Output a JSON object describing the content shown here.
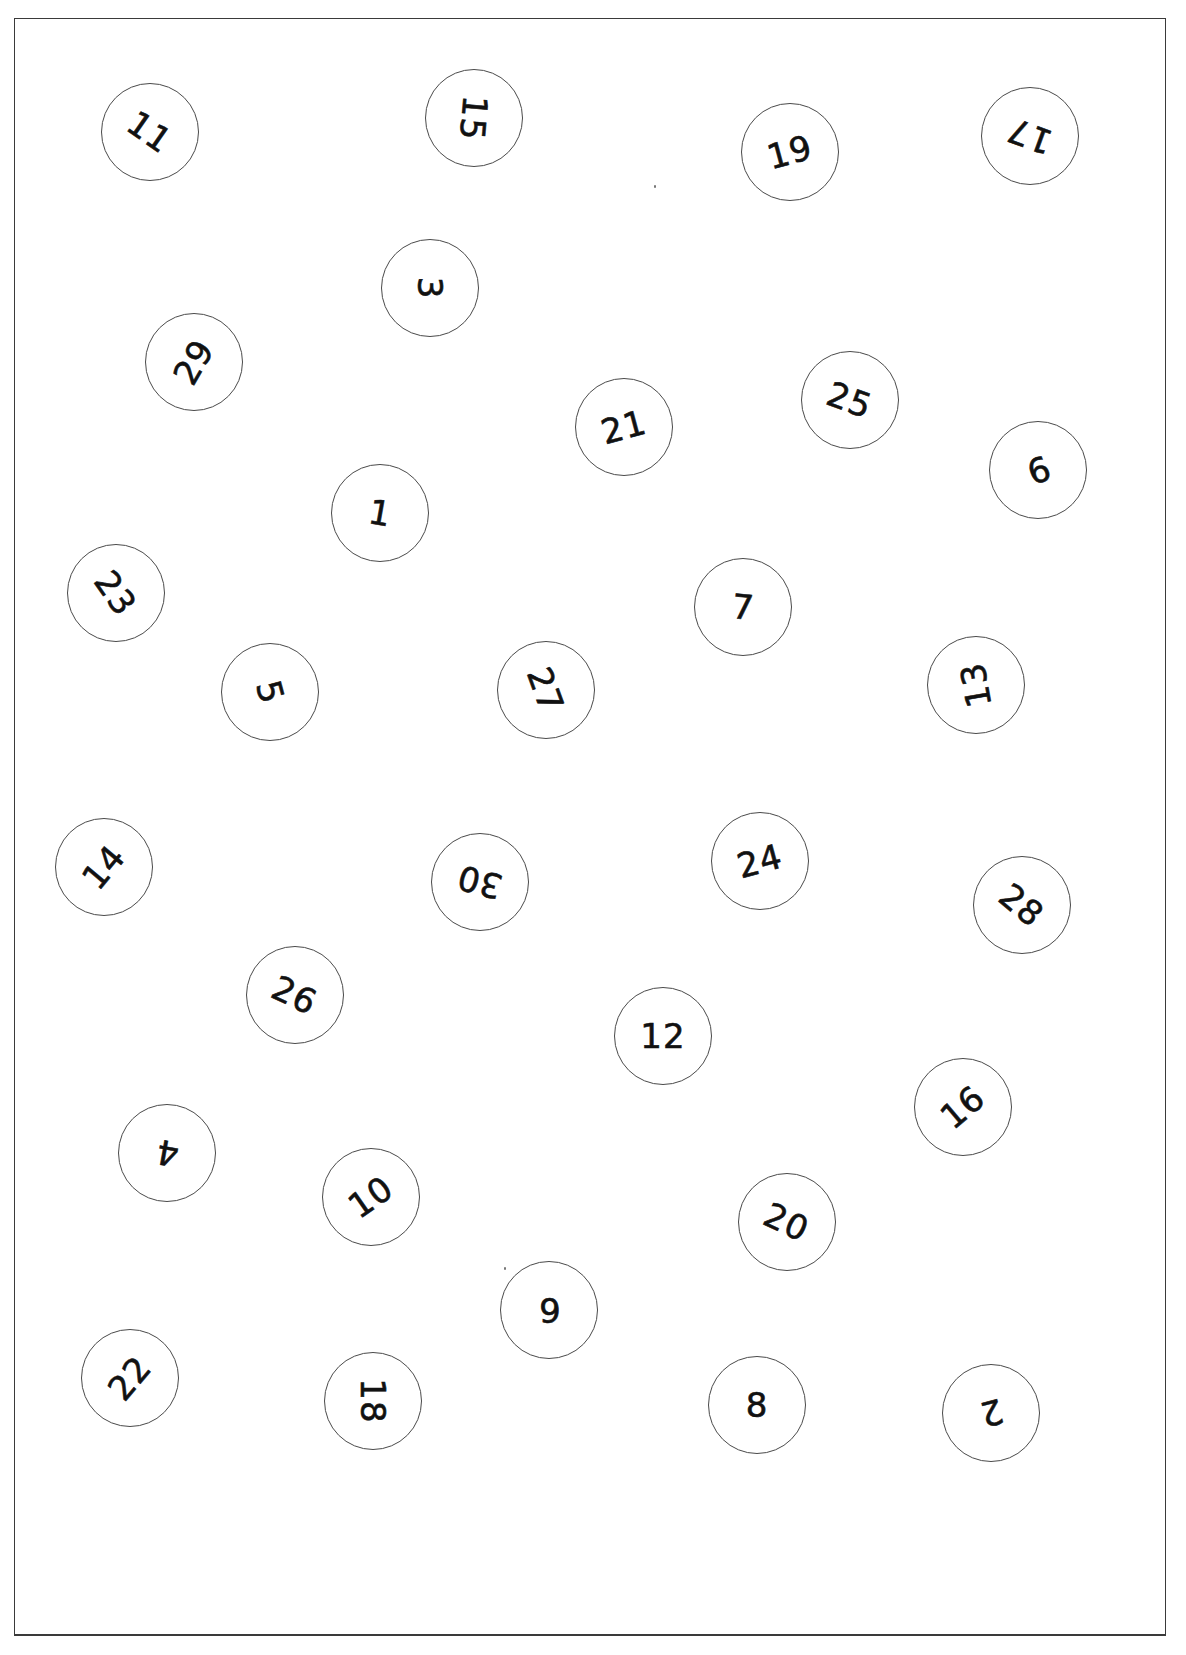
{
  "worksheet": {
    "type": "number-ordering-worksheet",
    "border_color": "#3a3a3a",
    "circle_border_color": "#4a4a4a",
    "text_color": "#111111",
    "circles": [
      {
        "label": "11",
        "x": 150,
        "y": 132,
        "rotate": 35
      },
      {
        "label": "15",
        "x": 474,
        "y": 118,
        "rotate": 95
      },
      {
        "label": "19",
        "x": 790,
        "y": 152,
        "rotate": -15
      },
      {
        "label": "17",
        "x": 1030,
        "y": 136,
        "rotate": 200
      },
      {
        "label": "3",
        "x": 430,
        "y": 288,
        "rotate": 90
      },
      {
        "label": "29",
        "x": 194,
        "y": 362,
        "rotate": -60
      },
      {
        "label": "21",
        "x": 624,
        "y": 427,
        "rotate": -15
      },
      {
        "label": "25",
        "x": 850,
        "y": 400,
        "rotate": 20
      },
      {
        "label": "9",
        "x": 1038,
        "y": 470,
        "rotate": 160
      },
      {
        "label": "1",
        "x": 380,
        "y": 513,
        "rotate": 10
      },
      {
        "label": "23",
        "x": 116,
        "y": 593,
        "rotate": 55
      },
      {
        "label": "7",
        "x": 743,
        "y": 607,
        "rotate": 5
      },
      {
        "label": "5",
        "x": 270,
        "y": 692,
        "rotate": 75
      },
      {
        "label": "27",
        "x": 546,
        "y": 690,
        "rotate": 70
      },
      {
        "label": "13",
        "x": 976,
        "y": 685,
        "rotate": 260
      },
      {
        "label": "14",
        "x": 104,
        "y": 867,
        "rotate": -50
      },
      {
        "label": "30",
        "x": 480,
        "y": 882,
        "rotate": 195
      },
      {
        "label": "24",
        "x": 760,
        "y": 861,
        "rotate": -15
      },
      {
        "label": "28",
        "x": 1022,
        "y": 905,
        "rotate": 40
      },
      {
        "label": "26",
        "x": 295,
        "y": 995,
        "rotate": 25
      },
      {
        "label": "12",
        "x": 663,
        "y": 1036,
        "rotate": 0
      },
      {
        "label": "16",
        "x": 963,
        "y": 1107,
        "rotate": -40
      },
      {
        "label": "4",
        "x": 167,
        "y": 1153,
        "rotate": 190
      },
      {
        "label": "10",
        "x": 371,
        "y": 1197,
        "rotate": -35
      },
      {
        "label": "20",
        "x": 787,
        "y": 1222,
        "rotate": 25
      },
      {
        "label": "6",
        "x": 549,
        "y": 1310,
        "rotate": 180
      },
      {
        "label": "22",
        "x": 130,
        "y": 1378,
        "rotate": -50
      },
      {
        "label": "18",
        "x": 373,
        "y": 1401,
        "rotate": 90
      },
      {
        "label": "8",
        "x": 757,
        "y": 1405,
        "rotate": 0
      },
      {
        "label": "2",
        "x": 991,
        "y": 1413,
        "rotate": 165
      }
    ]
  }
}
